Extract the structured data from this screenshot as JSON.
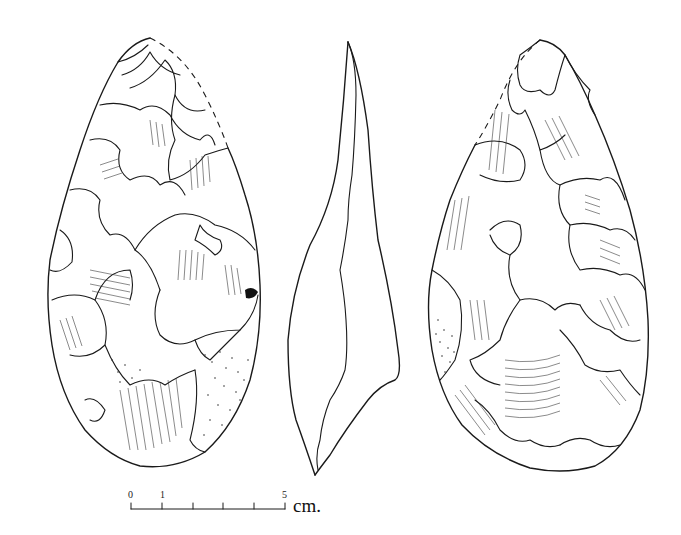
{
  "figure": {
    "views": [
      {
        "id": "face-a",
        "name": "Dorsal face"
      },
      {
        "id": "profile",
        "name": "Lateral profile"
      },
      {
        "id": "face-b",
        "name": "Ventral face"
      }
    ],
    "colors": {
      "ink": "#1a1a1a",
      "background": "#ffffff"
    }
  },
  "scale_bar": {
    "labels": {
      "start": "0",
      "first": "1",
      "end": "5"
    },
    "unit": "cm.",
    "ticks": 6
  }
}
